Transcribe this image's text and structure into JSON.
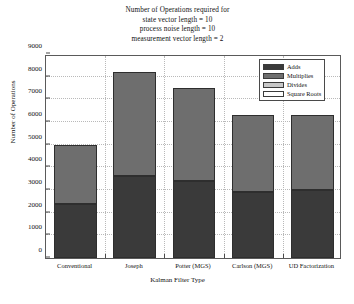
{
  "chart_data": {
    "type": "bar",
    "stacked": true,
    "title": "Number of Operations required for\nstate vector length = 10\nprocess noise length = 10\nmeasurement vector length = 2",
    "title_lines": [
      "Number of Operations required for",
      "state vector length = 10",
      "process noise length = 10",
      "measurement vector length = 2"
    ],
    "xlabel": "Kalman Filter Type",
    "ylabel": "Number of Operations",
    "categories": [
      "Conventional",
      "Joseph",
      "Potter (MGS)",
      "Carlson (MGS)",
      "UD Factorization"
    ],
    "series": [
      {
        "name": "Adds",
        "color": "#3a3a3a",
        "values": [
          2400,
          3600,
          3400,
          2900,
          3000
        ]
      },
      {
        "name": "Multiplies",
        "color": "#6e6e6e",
        "values": [
          2600,
          4600,
          4100,
          3400,
          3300
        ]
      },
      {
        "name": "Divides",
        "color": "#c8c8c8",
        "values": [
          0,
          0,
          0,
          0,
          0
        ]
      },
      {
        "name": "Square Roots",
        "color": "#ffffff",
        "values": [
          0,
          0,
          0,
          0,
          0
        ]
      }
    ],
    "totals": [
      5000,
      8200,
      7500,
      6300,
      6300
    ],
    "ylim": [
      0,
      9000
    ],
    "yticks": [
      0,
      1000,
      2000,
      3000,
      4000,
      5000,
      6000,
      7000,
      8000,
      9000
    ],
    "ytick_labels": [
      "0",
      "1000",
      "2000",
      "3000",
      "4000",
      "5000",
      "6000",
      "7000",
      "8000",
      "9000"
    ],
    "grid": true,
    "legend_position": "top-right",
    "legend_entries": [
      "Adds",
      "Multiplies",
      "Divides",
      "Square Roots"
    ]
  },
  "colors": {
    "background": "#ffffff",
    "plot_background": "#ffffff",
    "axis": "#5a5a5a",
    "gridline": "#b9b9b9",
    "text": "#111111"
  }
}
